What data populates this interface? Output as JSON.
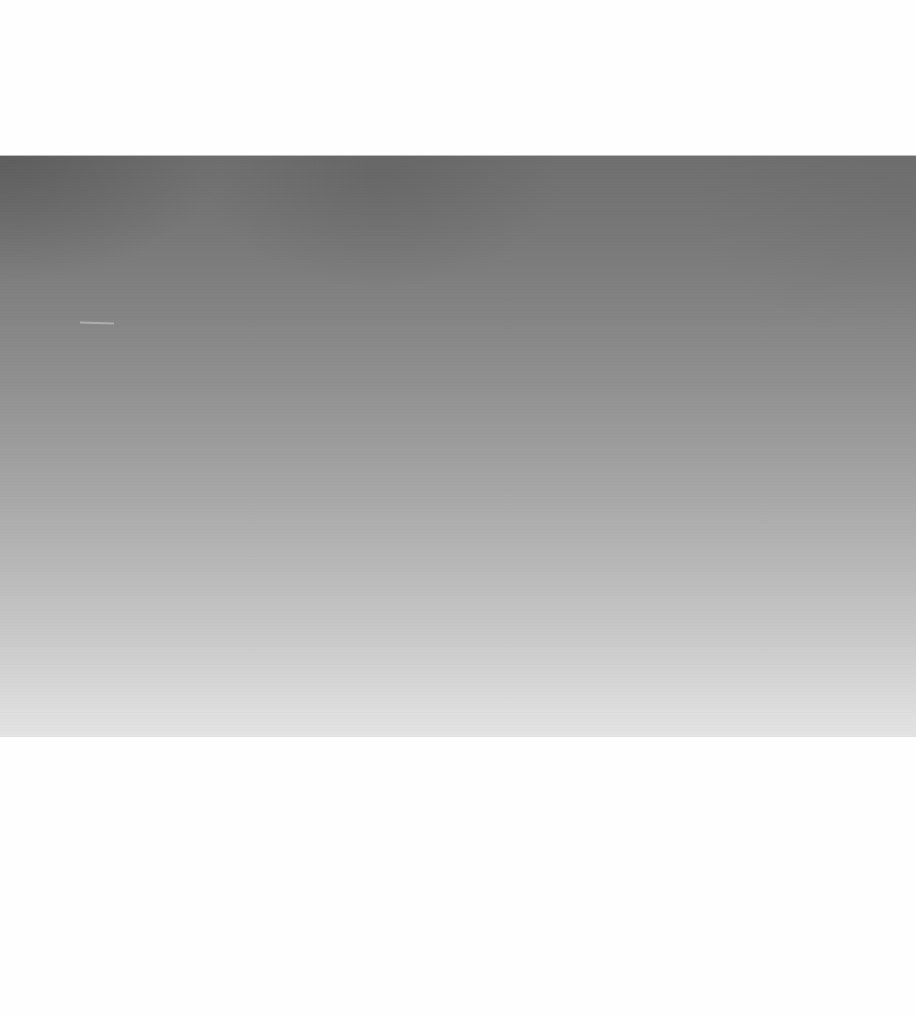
{
  "page": {
    "background_color": "#ffffff"
  },
  "photo": {
    "description": "Monochrome photograph of a smooth gray gradient (sky/atmosphere), dark at top fading to light at bottom",
    "gradient_top_color": "#6f6f6f",
    "gradient_bottom_color": "#e4e4e4",
    "bounds": {
      "x": 0,
      "y": 156,
      "width": 916,
      "height": 581
    }
  }
}
